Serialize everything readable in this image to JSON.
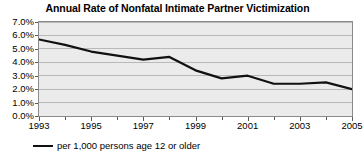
{
  "chart_data": {
    "type": "line",
    "title": "Annual Rate of Nonfatal Intimate Partner Victimization",
    "xlabel": "",
    "ylabel": "",
    "x": [
      1993,
      1994,
      1995,
      1996,
      1997,
      1998,
      1999,
      2000,
      2001,
      2002,
      2003,
      2004,
      2005
    ],
    "series": [
      {
        "name": "per 1,000 persons age 12 or older",
        "color": "#111111",
        "values": [
          5.7,
          5.3,
          4.8,
          4.5,
          4.2,
          4.4,
          3.4,
          2.8,
          3.0,
          2.4,
          2.4,
          2.5,
          2.0
        ]
      }
    ],
    "ylim": [
      0.0,
      7.0
    ],
    "ytick_values": [
      7.0,
      6.0,
      5.0,
      4.0,
      3.0,
      2.0,
      1.0,
      0.0
    ],
    "ytick_labels": [
      "7.0%",
      "6.0%",
      "5.0%",
      "4.0%",
      "3.0%",
      "2.0%",
      "1.0%",
      "0.0%"
    ],
    "xlim": [
      1993,
      2005
    ],
    "xtick_values": [
      1993,
      1995,
      1997,
      1999,
      2001,
      2003,
      2005
    ],
    "xtick_labels": [
      "1993",
      "1995",
      "1997",
      "1999",
      "2001",
      "2003",
      "2005"
    ],
    "xminor_tick_values": [
      1994,
      1996,
      1998,
      2000,
      2002,
      2004
    ],
    "grid": true,
    "grid_axis": "y",
    "grid_color": "#b9b9b9",
    "plot_background": "#ebebeb",
    "plot_border_color": "#8a8a8a",
    "legend_position": "below",
    "legend": [
      {
        "label": "per 1,000 persons age 12 or older",
        "color": "#111111"
      }
    ]
  }
}
